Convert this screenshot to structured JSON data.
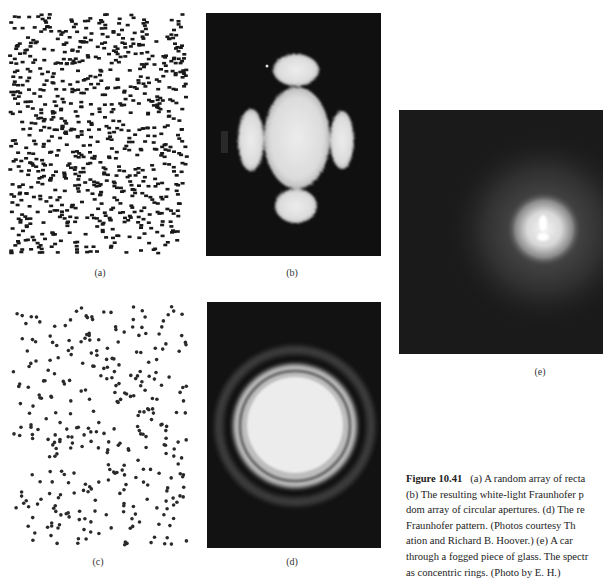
{
  "figure": {
    "number": "Figure 10.41",
    "caption_lines": [
      "(a) A random array of recta",
      "(b) The resulting white-light Fraunhofer p",
      "dom array of circular apertures. (d) The re",
      "Fraunhofer pattern. (Photos courtesy Th",
      "ation and Richard B. Hoover.) (e) A car",
      "through a fogged piece of glass. The spectr",
      "as concentric rings. (Photo by E. H.)"
    ]
  },
  "panels": {
    "a": {
      "label": "(a)",
      "content": "random array of rectangular apertures"
    },
    "b": {
      "label": "(b)",
      "content": "white-light Fraunhofer pattern of rectangles"
    },
    "c": {
      "label": "(c)",
      "content": "random array of circular apertures"
    },
    "d": {
      "label": "(d)",
      "content": "Fraunhofer pattern of circles (concentric rings)"
    },
    "e": {
      "label": "(e)",
      "content": "candle seen through fogged glass"
    }
  },
  "colors": {
    "dark_bg": "#101010",
    "glow": "#e8e8e8",
    "dots": "#1a1a1a"
  }
}
